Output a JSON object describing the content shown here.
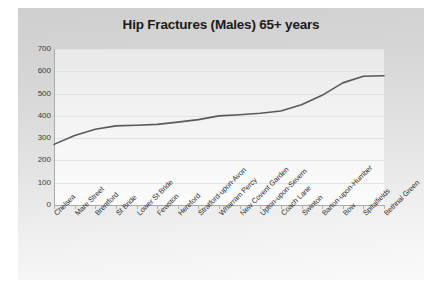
{
  "chart_data": {
    "type": "line",
    "title": "Hip Fractures (Males) 65+ years",
    "xlabel": "",
    "ylabel": "",
    "ylim": [
      0,
      700
    ],
    "ytick_step": 100,
    "yticks": [
      700,
      600,
      500,
      400,
      300,
      200,
      100,
      0
    ],
    "grid": true,
    "legend": false,
    "line_color": "#595959",
    "categories": [
      "Chelsea",
      "Mare Street",
      "Brentford",
      "St Bride",
      "Lower St Bride",
      "Fewston",
      "Hereford",
      "Stratford-upon-Avon",
      "Wharram Percy",
      "New Covent Garden",
      "Upton-upon-Severn",
      "Coach Lane",
      "Swinton",
      "Barton-upon-Humber",
      "Bow",
      "Spitalfields",
      "Bethnal Green"
    ],
    "values": [
      272,
      312,
      340,
      355,
      358,
      362,
      372,
      383,
      400,
      405,
      412,
      422,
      450,
      492,
      548,
      578,
      580
    ]
  },
  "panel": {
    "background": "#dcdcdc",
    "plot_background": "#f4f4f4",
    "gridline_color": "#e3e3e3",
    "axis_color": "#aaaaaa"
  }
}
